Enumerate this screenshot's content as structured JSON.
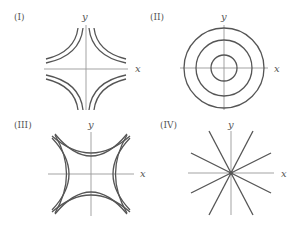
{
  "figure": {
    "panels": [
      {
        "id": "I",
        "label": "(I)",
        "x_axis": "x",
        "y_axis": "y",
        "description": "hyperbolas xy = c in four quadrants, concave toward origin"
      },
      {
        "id": "II",
        "label": "(II)",
        "x_axis": "x",
        "y_axis": "y",
        "description": "three concentric circles centered at origin"
      },
      {
        "id": "III",
        "label": "(III)",
        "x_axis": "x",
        "y_axis": "y",
        "description": "hyperbolas x^2 - y^2 = c opening left/right and up/down"
      },
      {
        "id": "IV",
        "label": "(IV)",
        "x_axis": "x",
        "y_axis": "y",
        "description": "straight lines through the origin"
      }
    ]
  },
  "colors": {
    "curve": "#555555",
    "axis": "#999999",
    "text": "#555555",
    "background": "#ffffff"
  }
}
